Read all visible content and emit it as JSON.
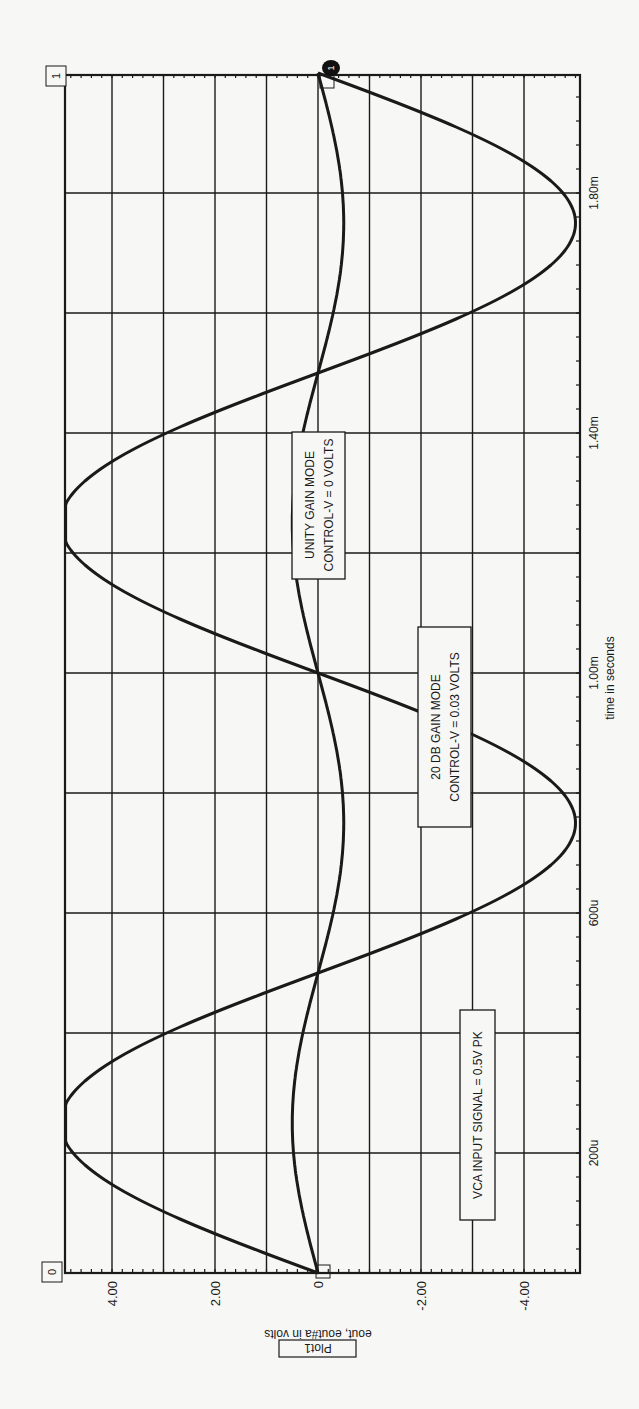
{
  "chart_data": {
    "type": "line",
    "orientation": "rotated -90deg (x-axis runs bottom-to-top along right edge)",
    "title": "Plot1",
    "xlabel": "time in seconds",
    "ylabel": "eout, eout#a in volts",
    "xlim": [
      0,
      0.002
    ],
    "ylim": [
      -5.0,
      4.9
    ],
    "x_ticks": [
      {
        "value": 0.0002,
        "label": "200u"
      },
      {
        "value": 0.0006,
        "label": "600u"
      },
      {
        "value": 0.001,
        "label": "1.00m"
      },
      {
        "value": 0.0014,
        "label": "1.40m"
      },
      {
        "value": 0.0018,
        "label": "1.80m"
      }
    ],
    "x_grid_step": 0.0002,
    "y_ticks": [
      {
        "value": 4,
        "label": "4.00"
      },
      {
        "value": 2,
        "label": "2.00"
      },
      {
        "value": 0,
        "label": "0"
      },
      {
        "value": -2,
        "label": "-2.00"
      },
      {
        "value": -4,
        "label": "-4.00"
      }
    ],
    "y_grid_step": 1,
    "grid": true,
    "series": [
      {
        "name": "eout (20 DB gain mode)",
        "amplitude": 5.0,
        "frequency_hz": 1000,
        "clip_max": 4.9,
        "clip_min": -5.0,
        "x": [
          0,
          0.00025,
          0.0005,
          0.00075,
          0.001,
          0.00125,
          0.0015,
          0.00175,
          0.002
        ],
        "values": [
          0,
          4.9,
          0,
          -5.0,
          0,
          4.9,
          0,
          -5.0,
          0
        ]
      },
      {
        "name": "eout#a (unity gain mode)",
        "amplitude": 0.5,
        "frequency_hz": 1000,
        "x": [
          0,
          0.00025,
          0.0005,
          0.00075,
          0.001,
          0.00125,
          0.0015,
          0.00175,
          0.002
        ],
        "values": [
          0,
          0.5,
          0,
          -0.5,
          0,
          0.5,
          0,
          -0.5,
          0
        ]
      }
    ],
    "annotations": [
      {
        "text": [
          "VCA INPUT SIGNAL = 0.5V PK"
        ]
      },
      {
        "text": [
          "20 DB GAIN MODE",
          "CONTROL-V = 0.03 VOLTS"
        ]
      },
      {
        "text": [
          "UNITY GAIN MODE",
          "CONTROL-V = 0 VOLTS"
        ]
      }
    ],
    "markers": {
      "start_label": "0",
      "end_label": "1"
    }
  },
  "labels": {
    "plot_title": "Plot1",
    "y_axis": "eout, eout#a in volts",
    "x_axis": "time in seconds",
    "ann_vca": "VCA INPUT SIGNAL = 0.5V PK",
    "ann_20db_1": "20 DB GAIN MODE",
    "ann_20db_2": "CONTROL-V = 0.03 VOLTS",
    "ann_unity_1": "UNITY GAIN MODE",
    "ann_unity_2": "CONTROL-V = 0 VOLTS",
    "marker_start": "0",
    "marker_end": "1",
    "marker_trace": "1"
  },
  "colors": {
    "paper": "#f7f7f5",
    "ink": "#1a1a1a"
  }
}
